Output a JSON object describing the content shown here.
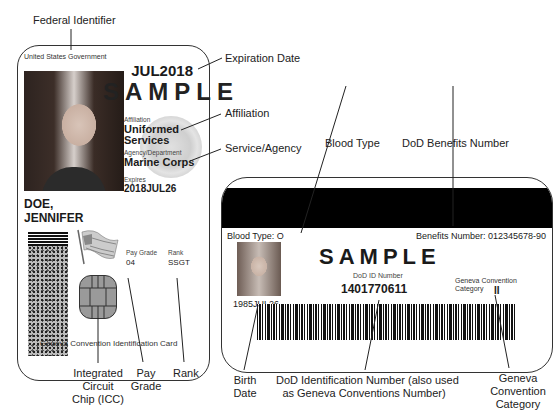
{
  "callouts": {
    "federal_identifier": "Federal Identifier",
    "expiration_date": "Expiration Date",
    "affiliation": "Affiliation",
    "service_agency": "Service/Agency",
    "blood_type": "Blood Type",
    "benefits_number": "DoD Benefits Number",
    "icc": [
      "Integrated",
      "Circuit",
      "Chip (ICC)"
    ],
    "pay_grade": [
      "Pay",
      "Grade"
    ],
    "rank": "Rank",
    "birth_date": [
      "Birth",
      "Date"
    ],
    "dod_id": [
      "DoD Identification Number (also used",
      "as Geneva Conventions Number)"
    ],
    "geneva_category": [
      "Geneva",
      "Convention",
      "Category"
    ]
  },
  "front": {
    "issuer": "United States Government",
    "expiration": "JUL2018",
    "watermark": "SAMPLE",
    "affiliation_label": "Affiliation",
    "affiliation_line1": "Uniformed",
    "affiliation_line2": "Services",
    "agency_label": "Agency/Department",
    "agency": "Marine Corps",
    "expires_label": "Expires",
    "expires": "2018JUL26",
    "name_line1": "DOE,",
    "name_line2": "JENNIFER",
    "pay_grade_label": "Pay Grade",
    "pay_grade": "04",
    "rank_label": "Rank",
    "rank": "SSGT",
    "footer": "Geneva Convention Identification Card"
  },
  "back": {
    "blood_type": "Blood Type: O",
    "benefits_number": "Benefits Number: 012345678-90",
    "watermark": "SAMPLE",
    "dod_id_label": "DoD ID Number",
    "dod_id": "1401770611",
    "geneva_label_line1": "Geneva Convention",
    "geneva_label_line2": "Category",
    "geneva_category": "II",
    "birth_date": "1985JUL26"
  }
}
